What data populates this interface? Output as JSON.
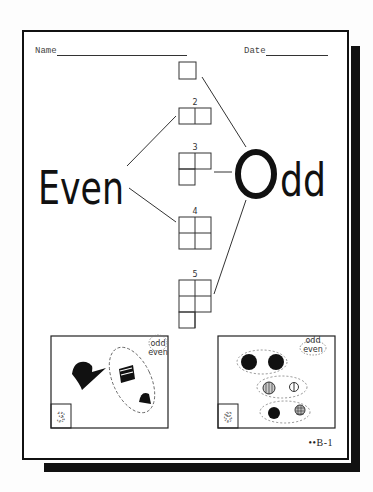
{
  "worksheet": {
    "header": {
      "name_label": "Name",
      "date_label": "Date"
    },
    "main_labels": {
      "even": "Even",
      "odd": "Odd"
    },
    "number_grids": [
      {
        "number": "",
        "cells": 1,
        "connects_to": "odd"
      },
      {
        "number": "2",
        "cells": 2,
        "connects_to": "even"
      },
      {
        "number": "3",
        "cells": 3,
        "connects_to": "odd"
      },
      {
        "number": "4",
        "cells": 4,
        "connects_to": "even"
      },
      {
        "number": "5",
        "cells": 5,
        "connects_to": "odd"
      }
    ],
    "picture_boxes": [
      {
        "choice_top": "odd",
        "choice_bottom": "even",
        "count": "3",
        "objects": [
          "bird",
          "striped cat",
          "bell"
        ]
      },
      {
        "choice_top": "odd",
        "choice_bottom": "even",
        "count": "6",
        "objects": [
          "black ball",
          "black ball",
          "striped ball",
          "small ball",
          "black ball",
          "checkered ball"
        ]
      }
    ],
    "footer_code": "••B-1"
  }
}
